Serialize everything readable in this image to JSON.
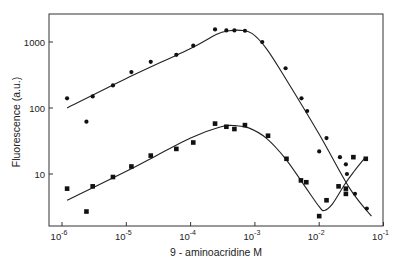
{
  "chart_data": {
    "type": "scatter",
    "title": "",
    "xlabel": "9 - aminoacridine  M",
    "ylabel": "Fluorescence  (a.u.)",
    "xscale": "log",
    "yscale": "log",
    "xlim": [
      7e-07,
      0.1
    ],
    "ylim": [
      2,
      2500
    ],
    "x_ticks": [
      1e-06,
      1e-05,
      0.0001,
      0.001,
      0.01,
      0.1
    ],
    "x_tick_labels": [
      {
        "base": "10",
        "exp": "-6"
      },
      {
        "base": "10",
        "exp": "-5"
      },
      {
        "base": "10",
        "exp": "-4"
      },
      {
        "base": "10",
        "exp": "-3"
      },
      {
        "base": "10",
        "exp": "-2"
      },
      {
        "base": "10",
        "exp": "-1"
      }
    ],
    "y_ticks": [
      10,
      100,
      1000
    ],
    "y_tick_labels": [
      "10",
      "100",
      "1000"
    ],
    "grid": false,
    "legend": null,
    "series": [
      {
        "name": "circles",
        "marker": "circle",
        "points": [
          [
            1.2e-06,
            140
          ],
          [
            2.4e-06,
            62
          ],
          [
            3e-06,
            150
          ],
          [
            6.2e-06,
            220
          ],
          [
            1.2e-05,
            350
          ],
          [
            2.4e-05,
            500
          ],
          [
            6e-05,
            640
          ],
          [
            0.00011,
            880
          ],
          [
            0.00024,
            1550
          ],
          [
            0.00036,
            1500
          ],
          [
            0.00048,
            1500
          ],
          [
            0.0007,
            1480
          ],
          [
            0.0013,
            1000
          ],
          [
            0.003,
            400
          ],
          [
            0.0053,
            140
          ],
          [
            0.0065,
            90
          ],
          [
            0.01,
            22
          ],
          [
            0.013,
            35
          ],
          [
            0.021,
            18
          ],
          [
            0.026,
            14
          ],
          [
            0.027,
            10
          ],
          [
            0.036,
            5
          ],
          [
            0.055,
            3
          ]
        ],
        "fit_curve": [
          [
            1.2e-06,
            100
          ],
          [
            1e-05,
            280
          ],
          [
            0.0001,
            800
          ],
          [
            0.00025,
            1300
          ],
          [
            0.0004,
            1480
          ],
          [
            0.0006,
            1500
          ],
          [
            0.0009,
            1350
          ],
          [
            0.0015,
            800
          ],
          [
            0.003,
            280
          ],
          [
            0.01,
            40
          ],
          [
            0.03,
            6
          ],
          [
            0.065,
            2.3
          ]
        ]
      },
      {
        "name": "squares",
        "marker": "square",
        "points": [
          [
            1.2e-06,
            6
          ],
          [
            2.4e-06,
            2.7
          ],
          [
            3e-06,
            6.5
          ],
          [
            6.2e-06,
            9
          ],
          [
            1.2e-05,
            13
          ],
          [
            2.4e-05,
            19
          ],
          [
            6e-05,
            24
          ],
          [
            0.00011,
            30
          ],
          [
            0.00024,
            58
          ],
          [
            0.00036,
            52
          ],
          [
            0.00048,
            48
          ],
          [
            0.0007,
            55
          ],
          [
            0.0016,
            38
          ],
          [
            0.0031,
            17
          ],
          [
            0.0052,
            8
          ],
          [
            0.0063,
            7.5
          ],
          [
            0.01,
            2.3
          ],
          [
            0.013,
            4
          ],
          [
            0.02,
            6.5
          ],
          [
            0.026,
            5
          ],
          [
            0.026,
            6
          ],
          [
            0.034,
            18
          ],
          [
            0.053,
            17
          ]
        ],
        "fit_curve": [
          [
            1.2e-06,
            4
          ],
          [
            1e-05,
            11
          ],
          [
            0.0001,
            35
          ],
          [
            0.0003,
            52
          ],
          [
            0.0005,
            54
          ],
          [
            0.0008,
            50
          ],
          [
            0.0015,
            35
          ],
          [
            0.003,
            17
          ],
          [
            0.006,
            6.5
          ],
          [
            0.01,
            3.2
          ],
          [
            0.012,
            2.8
          ],
          [
            0.016,
            3.5
          ],
          [
            0.025,
            7
          ],
          [
            0.035,
            11
          ],
          [
            0.05,
            17
          ]
        ]
      }
    ]
  }
}
